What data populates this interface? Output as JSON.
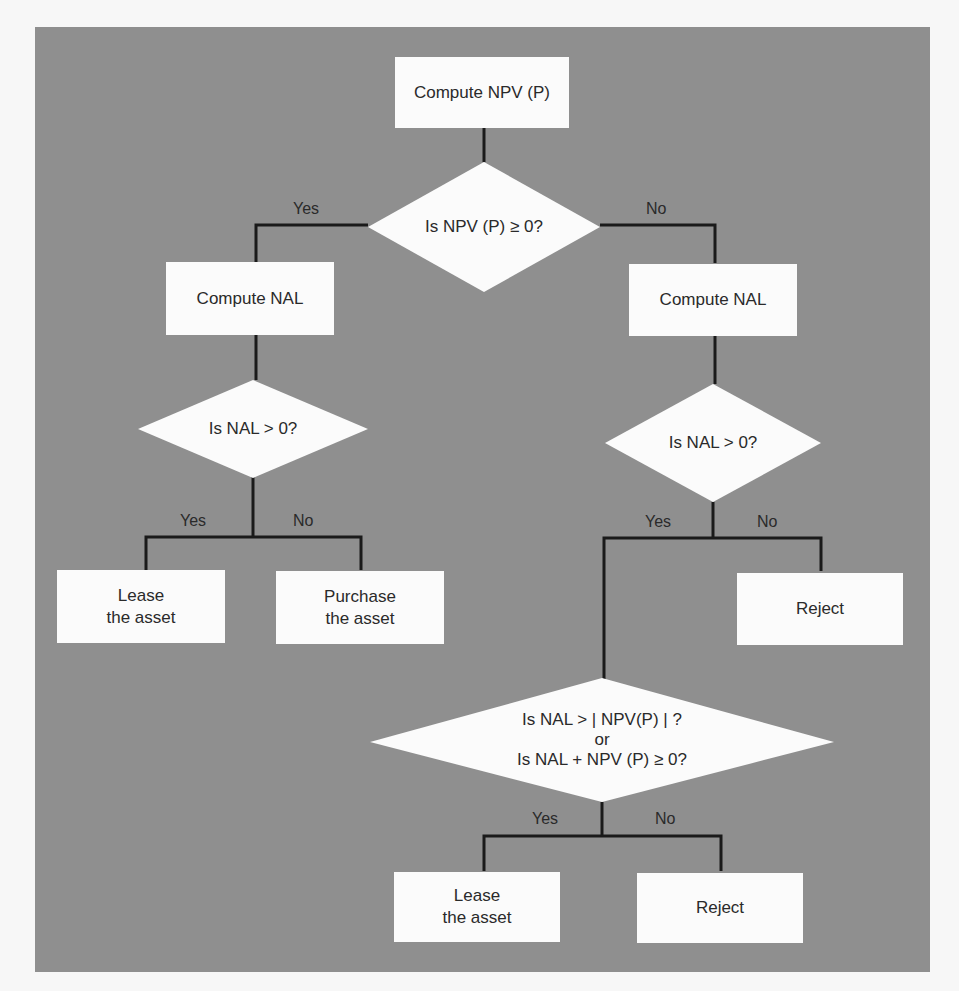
{
  "flowchart": {
    "colors": {
      "background": "#8f8f8f",
      "node_fill": "#fbfbfb",
      "line": "#1a1a1a",
      "text": "#2a2a2a"
    },
    "nodes": {
      "compute_npv": {
        "text": "Compute NPV (P)"
      },
      "decision_npv": {
        "text": "Is NPV (P) ≥ 0?"
      },
      "compute_nal_left": {
        "text": "Compute NAL"
      },
      "compute_nal_right": {
        "text": "Compute NAL"
      },
      "decision_nal_left": {
        "text": "Is NAL > 0?"
      },
      "decision_nal_right": {
        "text": "Is NAL > 0?"
      },
      "lease_left": {
        "line1": "Lease",
        "line2": "the asset"
      },
      "purchase": {
        "line1": "Purchase",
        "line2": "the asset"
      },
      "reject_right": {
        "text": "Reject"
      },
      "decision_combined": {
        "line1": "Is NAL > | NPV(P) | ?",
        "line2": "or",
        "line3": "Is NAL + NPV (P) ≥ 0?"
      },
      "lease_bottom": {
        "line1": "Lease",
        "line2": "the asset"
      },
      "reject_bottom": {
        "text": "Reject"
      }
    },
    "edge_labels": {
      "npv_yes": "Yes",
      "npv_no": "No",
      "nal_left_yes": "Yes",
      "nal_left_no": "No",
      "nal_right_yes": "Yes",
      "nal_right_no": "No",
      "combined_yes": "Yes",
      "combined_no": "No"
    }
  }
}
